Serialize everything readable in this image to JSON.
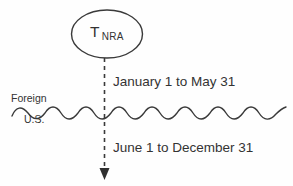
{
  "diagram": {
    "entity": {
      "symbol": "T",
      "subscript": "NRA",
      "shape": "ellipse"
    },
    "boundary": {
      "style": "wavy-line",
      "above_label": "Foreign",
      "below_label": "U.S."
    },
    "flow": {
      "style": "dashed-arrow-down",
      "direction": "downward"
    },
    "periods": [
      {
        "id": "first",
        "label": "January 1 to May 31"
      },
      {
        "id": "second",
        "label": "June 1 to December 31"
      }
    ],
    "colors": {
      "ink": "#333333",
      "stroke": "#3a3a3a",
      "background": "#fefefe"
    }
  }
}
